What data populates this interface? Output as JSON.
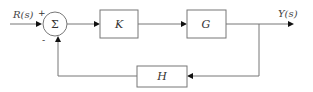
{
  "diagram": {
    "type": "feedback-control-block-diagram",
    "input_signal": "R(s)",
    "output_signal": "Y(s)",
    "summing_junction": {
      "symbol": "Σ",
      "input_signs": {
        "reference": "+",
        "feedback": "-"
      }
    },
    "blocks": [
      {
        "id": "K",
        "label": "K",
        "role": "controller"
      },
      {
        "id": "G",
        "label": "G",
        "role": "plant"
      },
      {
        "id": "H",
        "label": "H",
        "role": "feedback"
      }
    ],
    "connections": [
      {
        "from": "R(s)",
        "to": "summing_junction",
        "sign": "+"
      },
      {
        "from": "summing_junction",
        "to": "K"
      },
      {
        "from": "K",
        "to": "G"
      },
      {
        "from": "G",
        "to": "Y(s)"
      },
      {
        "from": "Y(s)",
        "to": "H"
      },
      {
        "from": "H",
        "to": "summing_junction",
        "sign": "-"
      }
    ]
  }
}
